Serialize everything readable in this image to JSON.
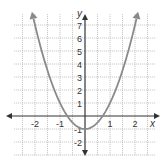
{
  "chart_data": {
    "type": "line",
    "title": "",
    "xlabel": "x",
    "ylabel": "y",
    "function": "y = 2x^2 - 1",
    "xlim": [
      -2.9,
      2.9
    ],
    "ylim": [
      -2.8,
      8.6
    ],
    "x_ticks": [
      -2,
      -1,
      1,
      2
    ],
    "y_ticks": [
      7,
      6,
      5,
      4,
      3,
      2,
      1,
      -1,
      -2
    ],
    "grid": true,
    "legend": null,
    "series": [
      {
        "name": "parabola",
        "x": [
          -2.1,
          -2,
          -1.5,
          -1,
          -0.707,
          -0.5,
          0,
          0.5,
          0.707,
          1,
          1.5,
          2,
          2.1
        ],
        "values": [
          7.82,
          7,
          3.5,
          1,
          0,
          -0.5,
          -1,
          -0.5,
          0,
          1,
          3.5,
          7,
          7.82
        ]
      }
    ],
    "vertex": [
      0,
      -1
    ],
    "colors": {
      "curve": "#8a8a8a",
      "axis": "#333333",
      "grid": "#bdbdbd"
    }
  }
}
